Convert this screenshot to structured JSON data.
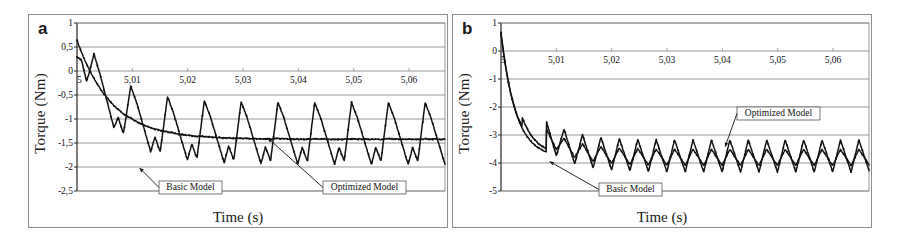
{
  "figure": {
    "panels": [
      {
        "letter": "a",
        "axis": {
          "ylabel": "Torque (Nm)",
          "xlabel": "Time (s)",
          "yticks": [
            "1",
            "0,5",
            "0",
            "-0,5",
            "-1",
            "-1,5",
            "-2",
            "-2,5"
          ],
          "ytick_values": [
            1,
            0.5,
            0,
            -0.5,
            -1,
            -1.5,
            -2,
            -2.5
          ],
          "xticks": [
            "5",
            "5,01",
            "5,02",
            "5,03",
            "5,04",
            "5,05",
            "5,06"
          ],
          "xtick_values": [
            5,
            5.01,
            5.02,
            5.03,
            5.04,
            5.05,
            5.06
          ],
          "xlim": [
            5.0,
            5.0665
          ],
          "ylim": [
            -2.5,
            1.0
          ],
          "grid": "horizontal"
        },
        "annotations": [
          {
            "label": "Basic Model",
            "target": "basic"
          },
          {
            "label": "Optimized Model",
            "target": "optimized"
          }
        ]
      },
      {
        "letter": "b",
        "axis": {
          "ylabel": "Torque (Nm)",
          "xlabel": "Time (s)",
          "yticks": [
            "1",
            "0",
            "-1",
            "-2",
            "-3",
            "-4",
            "-5"
          ],
          "ytick_values": [
            1,
            0,
            -1,
            -2,
            -3,
            -4,
            -5
          ],
          "xticks": [
            "5",
            "5,01",
            "5,02",
            "5,03",
            "5,04",
            "5,05",
            "5,06"
          ],
          "xtick_values": [
            5,
            5.01,
            5.02,
            5.03,
            5.04,
            5.05,
            5.06
          ],
          "xlim": [
            5.0,
            5.0665
          ],
          "ylim": [
            -5.0,
            1.0
          ],
          "grid": "horizontal"
        },
        "annotations": [
          {
            "label": "Optimized Model",
            "target": "optimized"
          },
          {
            "label": "Basic Model",
            "target": "basic"
          }
        ]
      }
    ]
  },
  "chart_data": [
    {
      "type": "line",
      "panel": "a",
      "title": "",
      "xlabel": "Time (s)",
      "ylabel": "Torque (Nm)",
      "xlim": [
        5.0,
        5.0665
      ],
      "ylim": [
        -2.5,
        1.0
      ],
      "xticks": [
        5,
        5.01,
        5.02,
        5.03,
        5.04,
        5.05,
        5.06
      ],
      "xtick_labels": [
        "5",
        "5,01",
        "5,02",
        "5,03",
        "5,04",
        "5,05",
        "5,06"
      ],
      "yticks": [
        1,
        0.5,
        0,
        -0.5,
        -1,
        -1.5,
        -2,
        -2.5
      ],
      "ytick_labels": [
        "1",
        "0,5",
        "0",
        "-0,5",
        "-1",
        "-1,5",
        "-2",
        "-2,5"
      ],
      "grid": "horizontal",
      "legend": "annotated-callouts",
      "markers": "small-filled-square",
      "series": [
        {
          "name": "Basic Model",
          "color": "#111111",
          "start_value": 0.65,
          "settle_mean": -1.3,
          "steady_peak": -0.66,
          "steady_trough": -1.95,
          "period_s": 0.00665,
          "cycles_visible": 10,
          "description": "Large sawtooth-like torque ripple; sharp rise to peak then fast fall to trough, with a small secondary bump before each main peak."
        },
        {
          "name": "Optimized Model",
          "color": "#111111",
          "start_value": 0.65,
          "settle_mean": -1.42,
          "steady_peak": -1.36,
          "steady_trough": -1.5,
          "period_s": 0.00665,
          "cycles_visible": 10,
          "description": "Rapidly decays from 0,65 to about -1,45 and remains nearly flat with very small ripple."
        }
      ]
    },
    {
      "type": "line",
      "panel": "b",
      "title": "",
      "xlabel": "Time (s)",
      "ylabel": "Torque (Nm)",
      "xlim": [
        5.0,
        5.0665
      ],
      "ylim": [
        -5.0,
        1.0
      ],
      "xticks": [
        5,
        5.01,
        5.02,
        5.03,
        5.04,
        5.05,
        5.06
      ],
      "xtick_labels": [
        "5",
        "5,01",
        "5,02",
        "5,03",
        "5,04",
        "5,05",
        "5,06"
      ],
      "yticks": [
        1,
        0,
        -1,
        -2,
        -3,
        -4,
        -5
      ],
      "ytick_labels": [
        "1",
        "0",
        "-1",
        "-2",
        "-3",
        "-4",
        "-5"
      ],
      "grid": "horizontal",
      "legend": "annotated-callouts",
      "markers": "small-filled-square",
      "series": [
        {
          "name": "Basic Model",
          "color": "#111111",
          "start_value": 0.65,
          "settle_mean": -3.75,
          "steady_peak": -3.05,
          "steady_trough": -4.2,
          "period_s": 0.00333,
          "cycles_visible": 19,
          "description": "Steep initial drop from 0,65 to about -3,2, a brief recovery bump, then settles into a dense triangular torque ripple between -3,05 and -4,2."
        },
        {
          "name": "Optimized Model",
          "color": "#111111",
          "start_value": 0.65,
          "settle_mean": -3.8,
          "steady_peak": -3.3,
          "steady_trough": -4.1,
          "period_s": 0.00333,
          "cycles_visible": 19,
          "description": "Follows the basic model closely; smoother rounded ripple of slightly smaller amplitude around -3,8."
        }
      ]
    }
  ]
}
